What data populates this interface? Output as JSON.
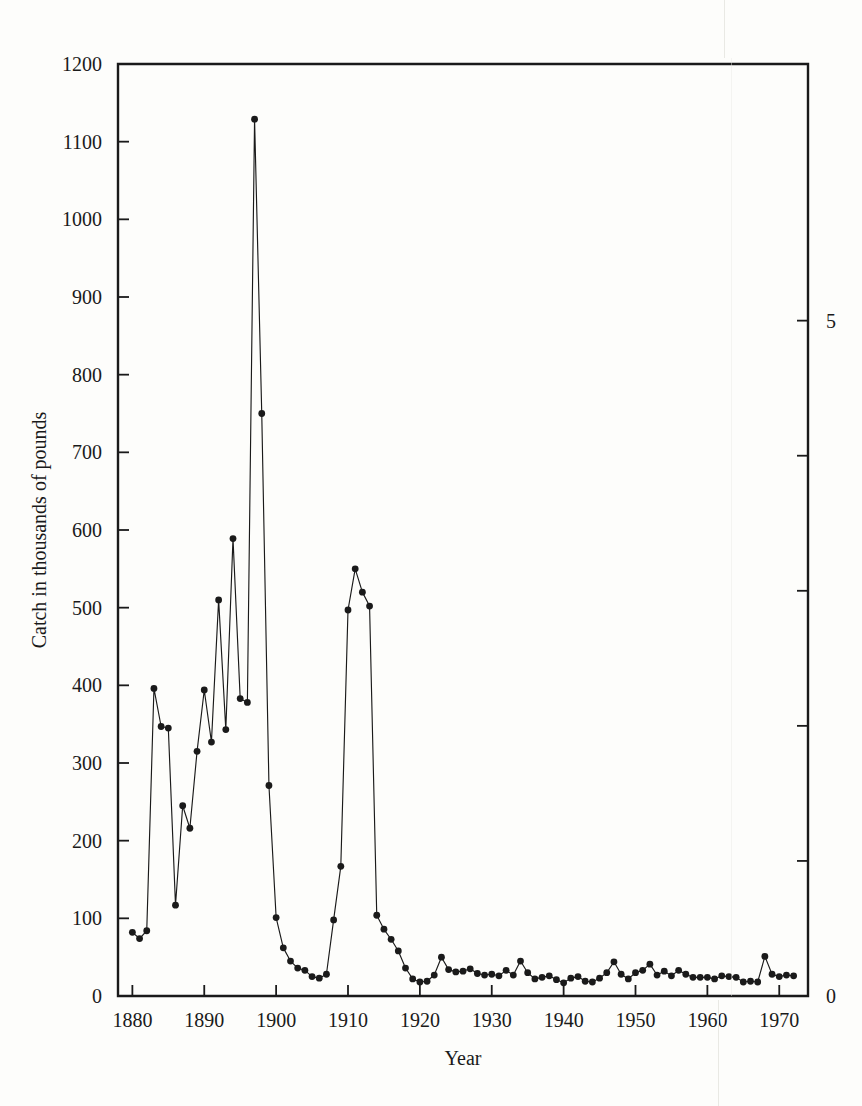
{
  "figure": {
    "background_color": "#fdfdfb",
    "ink_color": "#1a1a1a",
    "axis_title_x": "Year",
    "axis_title_y": "Catch in thousands of pounds"
  },
  "chart_data": {
    "type": "line",
    "title": "",
    "subtitle": "",
    "xlabel": "Year",
    "ylabel": "Catch in thousands of pounds",
    "ylabel_right": "",
    "xlim": [
      1878,
      1974
    ],
    "ylim": [
      0,
      1200
    ],
    "ylim_right": [
      0,
      6.9
    ],
    "grid": false,
    "legend": null,
    "marker": "filled-circle",
    "line_color": "#1a1a1a",
    "xticks": [
      1880,
      1890,
      1900,
      1910,
      1920,
      1930,
      1940,
      1950,
      1960,
      1970
    ],
    "xtick_labels": [
      "1880",
      "1890",
      "1900",
      "1910",
      "1920",
      "1930",
      "1940",
      "1950",
      "1960",
      "1970"
    ],
    "yticks": [
      0,
      100,
      200,
      300,
      400,
      500,
      600,
      700,
      800,
      900,
      1000,
      1100,
      1200
    ],
    "ytick_labels": [
      "0",
      "100",
      "200",
      "300",
      "400",
      "500",
      "600",
      "700",
      "800",
      "900",
      "1000",
      "1100",
      "1200"
    ],
    "yticks_right": [
      0,
      1,
      2,
      3,
      4,
      5
    ],
    "ytick_labels_right": [
      "0",
      "",
      "",
      "",
      "",
      "5"
    ],
    "x": [
      1880,
      1881,
      1882,
      1883,
      1884,
      1885,
      1886,
      1887,
      1888,
      1889,
      1890,
      1891,
      1892,
      1893,
      1894,
      1895,
      1896,
      1897,
      1898,
      1899,
      1900,
      1901,
      1902,
      1903,
      1904,
      1905,
      1906,
      1907,
      1908,
      1909,
      1910,
      1911,
      1912,
      1913,
      1914,
      1915,
      1916,
      1917,
      1918,
      1919,
      1920,
      1921,
      1922,
      1923,
      1924,
      1925,
      1926,
      1927,
      1928,
      1929,
      1930,
      1931,
      1932,
      1933,
      1934,
      1935,
      1936,
      1937,
      1938,
      1939,
      1940,
      1941,
      1942,
      1943,
      1944,
      1945,
      1946,
      1947,
      1948,
      1949,
      1950,
      1951,
      1952,
      1953,
      1954,
      1955,
      1956,
      1957,
      1958,
      1959,
      1960,
      1961,
      1962,
      1963,
      1964,
      1965,
      1966,
      1967,
      1968,
      1969,
      1970,
      1971,
      1972
    ],
    "values": [
      82,
      74,
      84,
      396,
      347,
      345,
      117,
      245,
      216,
      315,
      394,
      327,
      510,
      343,
      589,
      383,
      378,
      1129,
      750,
      271,
      101,
      62,
      45,
      36,
      33,
      25,
      23,
      28,
      98,
      167,
      497,
      550,
      520,
      502,
      104,
      86,
      73,
      58,
      36,
      22,
      18,
      19,
      27,
      50,
      34,
      31,
      32,
      35,
      29,
      27,
      28,
      26,
      33,
      27,
      45,
      30,
      22,
      24,
      26,
      21,
      17,
      23,
      25,
      19,
      18,
      23,
      30,
      44,
      28,
      22,
      30,
      33,
      41,
      27,
      32,
      26,
      33,
      28,
      24,
      24,
      24,
      22,
      26,
      25,
      24,
      18,
      19,
      18,
      51,
      28,
      25,
      27,
      26
    ]
  }
}
